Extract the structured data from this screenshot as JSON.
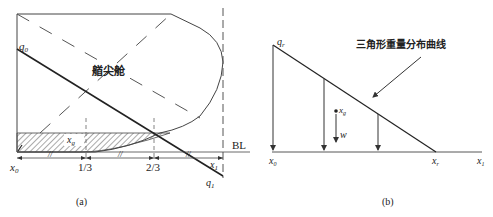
{
  "figure_a": {
    "caption": "(a)",
    "compartment_label": "艏尖舱",
    "q_top": "q",
    "q_top_sub": "0",
    "q_bottom": "q",
    "q_bottom_sub": "1",
    "baseline": "BL",
    "x_start": "x",
    "x_start_sub": "0",
    "x_end": "x",
    "x_end_sub": "1",
    "centroid": "x",
    "centroid_sub": "g",
    "tick_1": "1/3",
    "tick_2": "2/3",
    "equal_mark": "//"
  },
  "figure_b": {
    "caption": "(b)",
    "curve_label": "三角形重量分布曲线",
    "q_label": "q",
    "q_sub": "r",
    "centroid": "x",
    "centroid_sub": "g",
    "weight": "w",
    "x_start": "x",
    "x_start_sub": "0",
    "x_r": "x",
    "x_r_sub": "r",
    "x_end": "x",
    "x_end_sub": "1"
  },
  "colors": {
    "line": "#333333",
    "hatch": "#555555"
  }
}
